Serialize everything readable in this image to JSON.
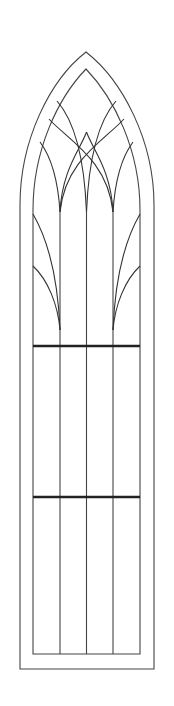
{
  "figure": {
    "colors": {
      "background": "#ffffff",
      "line": "#444444",
      "tracery": "#333333",
      "transom": "#222222"
    },
    "outer_frame": {
      "left": 20,
      "right": 154,
      "apex_y": 52,
      "spring_y": 175,
      "bottom": 669
    },
    "inner_frame": {
      "left": 33,
      "right": 140,
      "apex_y": 69,
      "spring_y": 185,
      "bottom": 654
    },
    "mullions_x": [
      60,
      86.5,
      113
    ],
    "transoms_y": [
      346,
      497
    ],
    "panel_count": 4,
    "transom_count": 2
  }
}
